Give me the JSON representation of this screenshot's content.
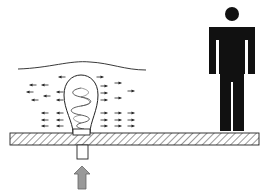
{
  "diagram": {
    "colors": {
      "line": "#222222",
      "figure": "#111111",
      "floor_fill": "#ffffff",
      "hatch": "#333333",
      "input_arrow": "#999999",
      "input_arrow_stroke": "#666666"
    },
    "elements": {
      "floor": {
        "x": 10,
        "y": 133,
        "w": 249,
        "h": 12
      },
      "bulb": {
        "cx": 81,
        "base_y": 133,
        "top_y": 75
      },
      "socket": {
        "x": 73,
        "y": 129,
        "w": 17,
        "h": 6
      },
      "stem": {
        "x": 77,
        "y": 145,
        "w": 11,
        "h": 14
      },
      "input_arrow": {
        "x": 82,
        "y": 165,
        "direction": "up"
      },
      "person": {
        "x": 209,
        "y": 7,
        "w": 46,
        "h": 124
      },
      "boundary_curve": {
        "from_x": 18,
        "to_x": 146,
        "y": 68
      }
    },
    "flow_arrows": [
      {
        "x": 33,
        "y": 85,
        "dir": "left"
      },
      {
        "x": 45,
        "y": 85,
        "dir": "left"
      },
      {
        "x": 30,
        "y": 92,
        "dir": "left"
      },
      {
        "x": 47,
        "y": 96,
        "dir": "left"
      },
      {
        "x": 60,
        "y": 92,
        "dir": "left"
      },
      {
        "x": 35,
        "y": 100,
        "dir": "left"
      },
      {
        "x": 60,
        "y": 100,
        "dir": "left"
      },
      {
        "x": 45,
        "y": 113,
        "dir": "left"
      },
      {
        "x": 60,
        "y": 113,
        "dir": "left"
      },
      {
        "x": 45,
        "y": 120,
        "dir": "left"
      },
      {
        "x": 60,
        "y": 120,
        "dir": "left"
      },
      {
        "x": 45,
        "y": 126,
        "dir": "left"
      },
      {
        "x": 60,
        "y": 126,
        "dir": "left"
      },
      {
        "x": 104,
        "y": 86,
        "dir": "right"
      },
      {
        "x": 118,
        "y": 83,
        "dir": "right"
      },
      {
        "x": 104,
        "y": 93,
        "dir": "right"
      },
      {
        "x": 131,
        "y": 91,
        "dir": "right"
      },
      {
        "x": 104,
        "y": 100,
        "dir": "right"
      },
      {
        "x": 118,
        "y": 98,
        "dir": "right"
      },
      {
        "x": 104,
        "y": 113,
        "dir": "right"
      },
      {
        "x": 118,
        "y": 113,
        "dir": "right"
      },
      {
        "x": 131,
        "y": 113,
        "dir": "right"
      },
      {
        "x": 104,
        "y": 120,
        "dir": "right"
      },
      {
        "x": 118,
        "y": 120,
        "dir": "right"
      },
      {
        "x": 131,
        "y": 120,
        "dir": "right"
      },
      {
        "x": 104,
        "y": 126,
        "dir": "right"
      },
      {
        "x": 118,
        "y": 126,
        "dir": "right"
      },
      {
        "x": 131,
        "y": 126,
        "dir": "right"
      },
      {
        "x": 62,
        "y": 77,
        "dir": "left"
      },
      {
        "x": 100,
        "y": 77,
        "dir": "right"
      }
    ]
  }
}
